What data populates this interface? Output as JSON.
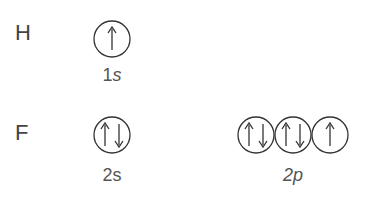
{
  "atoms": [
    {
      "symbol": "H",
      "orbitals": [
        {
          "label_number": "1",
          "label_subshell": "s",
          "boxes": [
            [
              "up"
            ]
          ]
        }
      ]
    },
    {
      "symbol": "F",
      "orbitals": [
        {
          "label_number": "2",
          "label_subshell": "s",
          "boxes": [
            [
              "up",
              "down"
            ]
          ]
        },
        {
          "label_number": "2",
          "label_subshell": "p",
          "boxes": [
            [
              "up",
              "down"
            ],
            [
              "up",
              "down"
            ],
            [
              "up"
            ]
          ]
        }
      ]
    }
  ],
  "colors": {
    "stroke": "#333333",
    "text": "#444444",
    "background": "#ffffff"
  }
}
